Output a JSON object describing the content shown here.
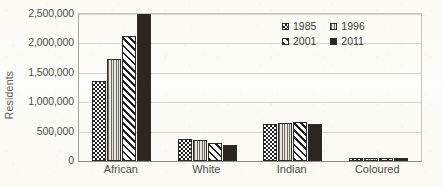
{
  "chart_data": {
    "type": "bar",
    "title": "",
    "xlabel": "",
    "ylabel": "Residents",
    "ylim": [
      0,
      2500000
    ],
    "ytick_labels": [
      "0",
      "500,000",
      "1,000,000",
      "1,500,000",
      "2,000,000",
      "2,500,000"
    ],
    "ytick_values": [
      0,
      500000,
      1000000,
      1500000,
      2000000,
      2500000
    ],
    "grid": true,
    "legend_position": "upper right",
    "categories": [
      "African",
      "White",
      "Indian",
      "Coloured"
    ],
    "series": [
      {
        "name": "1985",
        "pattern": "checkerboard",
        "values": [
          1360000,
          370000,
          630000,
          35000
        ]
      },
      {
        "name": "1996",
        "pattern": "vertical-lines",
        "values": [
          1730000,
          355000,
          655000,
          40000
        ]
      },
      {
        "name": "2001",
        "pattern": "diagonal-hatch",
        "values": [
          2120000,
          300000,
          670000,
          45000
        ]
      },
      {
        "name": "2011",
        "pattern": "solid",
        "values": [
          2500000,
          265000,
          625000,
          50000
        ]
      }
    ]
  },
  "colors": {
    "background": "#fdfdfa",
    "axis": "#8e8a80",
    "gridline": "#d8d4c9",
    "text": "#4f4c45",
    "series_1985": "#241f1b",
    "series_1996": "#6f6b62",
    "series_2001": "#241f1b",
    "series_2011": "#2b2620"
  }
}
